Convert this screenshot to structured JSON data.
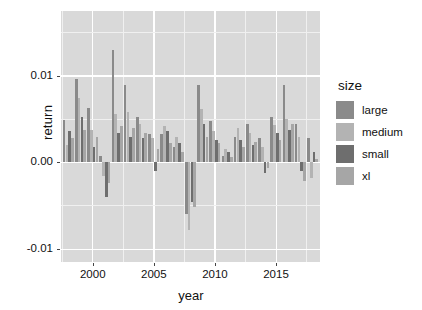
{
  "chart_data": {
    "type": "bar",
    "title": "",
    "xlabel": "year",
    "ylabel": "return",
    "xlim": [
      1997.4,
      2018.6
    ],
    "ylim": [
      -0.0115,
      0.0175
    ],
    "xticks": [
      2000,
      2005,
      2010,
      2015
    ],
    "yticks": [
      -0.01,
      0.0,
      0.01
    ],
    "ytick_labels": [
      "-0.01",
      "0.00",
      "0.01"
    ],
    "xtick_labels": [
      "2000",
      "2005",
      "2010",
      "2015"
    ],
    "grid": true,
    "legend": {
      "title": "size",
      "position": "right",
      "entries": [
        {
          "label": "large",
          "color": "#8a8a8a"
        },
        {
          "label": "medium",
          "color": "#b3b3b3"
        },
        {
          "label": "small",
          "color": "#6e6e6e"
        },
        {
          "label": "xl",
          "color": "#a6a6a6"
        }
      ]
    },
    "categories": [
      1998,
      1999,
      2000,
      2001,
      2002,
      2003,
      2004,
      2005,
      2006,
      2007,
      2008,
      2009,
      2010,
      2011,
      2012,
      2013,
      2014,
      2015,
      2016,
      2017,
      2018
    ],
    "series": [
      {
        "name": "large",
        "color": "#8a8a8a",
        "values": [
          0.0049,
          0.0096,
          0.0063,
          0.0008,
          0.013,
          0.0089,
          0.0052,
          0.0033,
          0.0033,
          0.0018,
          -0.006,
          0.009,
          0.0048,
          0.0008,
          0.003,
          0.0044,
          0.0028,
          0.0052,
          0.009,
          0.0044,
          0.0028
        ]
      },
      {
        "name": "medium",
        "color": "#b3b3b3",
        "values": [
          0.002,
          0.0075,
          0.0038,
          -0.0016,
          0.0056,
          0.0058,
          0.0045,
          0.0028,
          0.0042,
          0.003,
          -0.0078,
          0.0062,
          0.0036,
          0.0015,
          0.004,
          0.0034,
          0.0018,
          0.0043,
          0.005,
          0.003,
          -0.0018
        ]
      },
      {
        "name": "small",
        "color": "#6e6e6e",
        "values": [
          0.0036,
          0.0052,
          0.0018,
          -0.004,
          0.0034,
          0.003,
          0.0028,
          -0.001,
          0.0036,
          0.0022,
          -0.0046,
          0.0044,
          0.0026,
          0.0012,
          0.0026,
          0.002,
          -0.0012,
          0.0034,
          0.0038,
          -0.001,
          0.0012
        ]
      },
      {
        "name": "xl",
        "color": "#a6a6a6",
        "values": [
          0.0028,
          0.0038,
          0.003,
          -0.0024,
          0.0042,
          0.004,
          0.0034,
          0.0016,
          0.0022,
          0.0012,
          -0.0052,
          0.003,
          0.0022,
          0.0006,
          0.0018,
          0.0024,
          -0.0006,
          0.0026,
          0.0044,
          -0.0022,
          0.0004
        ]
      }
    ]
  }
}
